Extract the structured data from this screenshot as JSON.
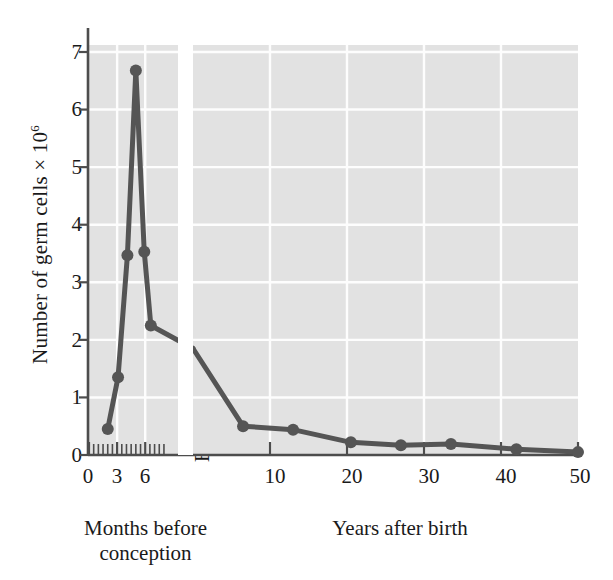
{
  "chart_data": {
    "type": "line",
    "title": "",
    "ylabel": "Number of germ cells × 10⁶",
    "ylabel_text": "Number of germ cells × 10",
    "ylabel_exponent": "6",
    "ylim": [
      0,
      7.3
    ],
    "yticks": [
      0,
      1,
      2,
      3,
      4,
      5,
      6,
      7
    ],
    "ytick_labels": [
      "0",
      "1",
      "2",
      "3",
      "4",
      "5",
      "6",
      "7"
    ],
    "grid": true,
    "legend": "none",
    "panels": [
      {
        "name": "months-before-conception",
        "xlabel_line1": "Months before",
        "xlabel_line2": "conception",
        "xlim": [
          0,
          9.5
        ],
        "xticks_major": [
          0,
          3,
          6
        ],
        "xtick_labels": [
          "0",
          "3",
          "6"
        ],
        "xticks_minor": [
          0.5,
          1,
          1.5,
          2,
          2.5,
          3.5,
          4,
          4.5,
          5,
          5.5,
          6.5,
          7,
          7.5,
          8
        ],
        "x_units": "months",
        "points": [
          {
            "x": 2.0,
            "y": 0.45
          },
          {
            "x": 3.1,
            "y": 1.35
          },
          {
            "x": 4.1,
            "y": 3.47
          },
          {
            "x": 5.0,
            "y": 6.68
          },
          {
            "x": 5.9,
            "y": 3.53
          },
          {
            "x": 6.6,
            "y": 2.25
          }
        ]
      },
      {
        "name": "years-after-birth",
        "xlabel": "Years after birth",
        "xlim": [
          0,
          50
        ],
        "xticks_major": [
          10,
          20,
          30,
          40,
          50
        ],
        "xtick_labels": [
          "10",
          "20",
          "30",
          "40",
          "50"
        ],
        "x_units": "years",
        "birth_tick_label": "Birth",
        "points": [
          {
            "x": 0,
            "y": 1.85
          },
          {
            "x": 6.5,
            "y": 0.5
          },
          {
            "x": 13.0,
            "y": 0.44
          },
          {
            "x": 20.5,
            "y": 0.22
          },
          {
            "x": 27.0,
            "y": 0.17
          },
          {
            "x": 33.5,
            "y": 0.19
          },
          {
            "x": 42.0,
            "y": 0.1
          },
          {
            "x": 50.0,
            "y": 0.05
          }
        ]
      }
    ],
    "colors": {
      "line": "#555555",
      "marker": "#555555",
      "plot_background": "#e2e2e2",
      "gridline": "#fdfdfd",
      "axis": "#4d4d4d",
      "text": "#1a1a1a",
      "page_background": "#ffffff"
    }
  }
}
